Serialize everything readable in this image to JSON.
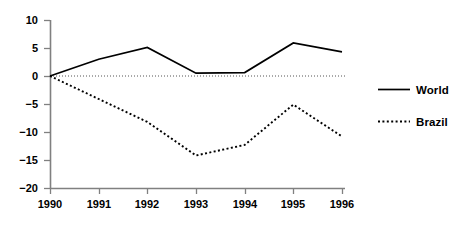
{
  "chart_data": {
    "type": "line",
    "title": "",
    "subtitle": "",
    "xlabel": "",
    "ylabel": "",
    "categories": [
      "1990",
      "1991",
      "1992",
      "1993",
      "1994",
      "1995",
      "1996"
    ],
    "x": [
      1990,
      1991,
      1992,
      1993,
      1994,
      1995,
      1996
    ],
    "series": [
      {
        "name": "World",
        "style": "solid",
        "color": "#000000",
        "values": [
          0,
          3.0,
          5.1,
          0.5,
          0.6,
          5.9,
          4.3
        ]
      },
      {
        "name": "Brazil",
        "style": "dotted",
        "color": "#000000",
        "values": [
          0,
          -4.1,
          -8.2,
          -14.2,
          -12.3,
          -5.1,
          -10.8
        ]
      }
    ],
    "ylim": [
      -20,
      10
    ],
    "yticks": [
      10,
      5,
      0,
      -5,
      -10,
      -15,
      -20
    ],
    "ytick_labels": [
      "10",
      "5",
      "0",
      "−5",
      "−10",
      "−15",
      "−20"
    ],
    "xtick_labels": [
      "1990",
      "1991",
      "1992",
      "1993",
      "1994",
      "1995",
      "1996"
    ],
    "grid": false,
    "zero_line": true,
    "zero_line_style": "dotted",
    "legend_position": "right",
    "legend": [
      "World",
      "Brazil"
    ],
    "axis_color": "#808080",
    "line_color": "#000000"
  },
  "legend": {
    "entries": [
      {
        "label": "World"
      },
      {
        "label": "Brazil"
      }
    ]
  }
}
